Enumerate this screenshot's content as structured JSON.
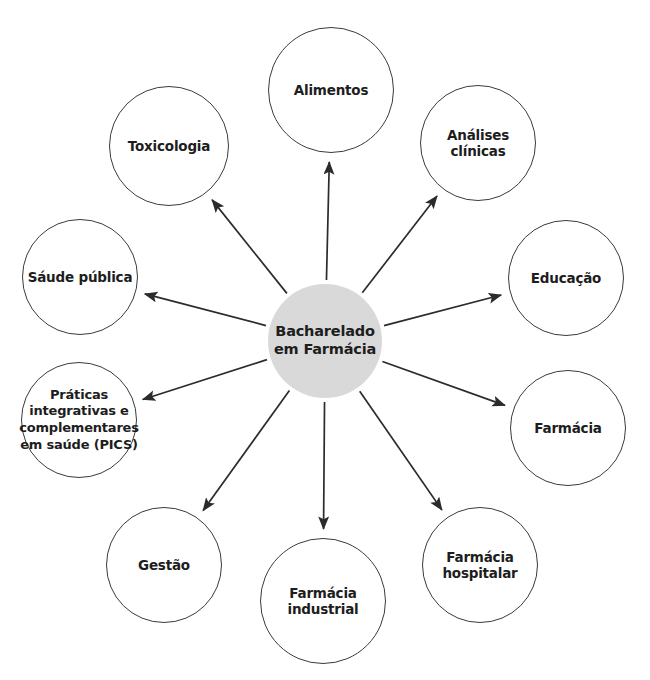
{
  "diagram": {
    "type": "radial-hub-and-spoke",
    "title": "Bacharelado em Farmácia",
    "colors": {
      "center_fill": "#d9d9d9",
      "satellite_fill": "#ffffff",
      "stroke": "#3b3b3b",
      "text": "#1d1d1d",
      "background": "#ffffff"
    },
    "center": {
      "id": "center",
      "label": "Bacharelado\nem Farmácia",
      "cx": 325,
      "cy": 341,
      "r": 57
    },
    "nodes": [
      {
        "id": "alimentos",
        "label": "Alimentos",
        "cx": 331,
        "cy": 90,
        "r": 63
      },
      {
        "id": "analises-clinicas",
        "label": "Análises\nclínicas",
        "cx": 478,
        "cy": 143,
        "r": 58
      },
      {
        "id": "educacao",
        "label": "Educação",
        "cx": 566,
        "cy": 278,
        "r": 58
      },
      {
        "id": "farmacia",
        "label": "Farmácia",
        "cx": 568,
        "cy": 428,
        "r": 58
      },
      {
        "id": "farmacia-hospitalar",
        "label": "Farmácia\nhospitalar",
        "cx": 480,
        "cy": 565,
        "r": 58
      },
      {
        "id": "farmacia-industrial",
        "label": "Farmácia\nindustrial",
        "cx": 323,
        "cy": 601,
        "r": 63
      },
      {
        "id": "gestao",
        "label": "Gestão",
        "cx": 164,
        "cy": 565,
        "r": 58
      },
      {
        "id": "pics",
        "label": "Práticas\nintegrativas e\ncomplementares\nem saúde (PICS)",
        "cx": 79,
        "cy": 420,
        "r": 58
      },
      {
        "id": "saude-publica",
        "label": "Sáude pública",
        "cx": 80,
        "cy": 277,
        "r": 58
      },
      {
        "id": "toxicologia",
        "label": "Toxicologia",
        "cx": 169,
        "cy": 146,
        "r": 60
      }
    ],
    "edges": [
      {
        "from": "center",
        "to": "alimentos",
        "direction": "outward"
      },
      {
        "from": "center",
        "to": "analises-clinicas",
        "direction": "outward"
      },
      {
        "from": "center",
        "to": "educacao",
        "direction": "outward"
      },
      {
        "from": "center",
        "to": "farmacia",
        "direction": "outward"
      },
      {
        "from": "center",
        "to": "farmacia-hospitalar",
        "direction": "outward"
      },
      {
        "from": "center",
        "to": "farmacia-industrial",
        "direction": "outward"
      },
      {
        "from": "center",
        "to": "gestao",
        "direction": "outward"
      },
      {
        "from": "center",
        "to": "pics",
        "direction": "outward"
      },
      {
        "from": "center",
        "to": "saude-publica",
        "direction": "outward"
      },
      {
        "from": "center",
        "to": "toxicologia",
        "direction": "outward"
      }
    ]
  }
}
